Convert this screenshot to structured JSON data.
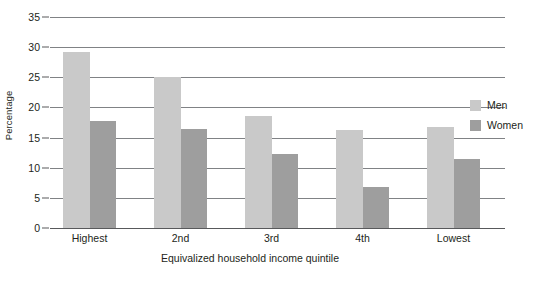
{
  "chart_data": {
    "type": "bar",
    "title": "",
    "subtitle": "",
    "xlabel": "Equivalized household income quintile",
    "ylabel": "Percentage",
    "categories": [
      "Highest",
      "2nd",
      "3rd",
      "4th",
      "Lowest"
    ],
    "series": [
      {
        "name": "Men",
        "color": "#c9c9c9",
        "values": [
          29.2,
          25.0,
          18.5,
          16.3,
          16.8
        ]
      },
      {
        "name": "Women",
        "color": "#9e9e9e",
        "values": [
          17.7,
          16.5,
          12.2,
          6.8,
          11.5
        ]
      }
    ],
    "ylim": [
      0,
      35
    ],
    "yticks": [
      0,
      5,
      10,
      15,
      20,
      25,
      30,
      35
    ],
    "ytick_labels": [
      "0",
      "5",
      "10",
      "15",
      "20",
      "25",
      "30",
      "35"
    ],
    "grid": "horizontal",
    "legend_position": "right",
    "annotations": []
  },
  "legend": {
    "items": [
      {
        "label": "Men",
        "swatch": "#c9c9c9"
      },
      {
        "label": "Women",
        "swatch": "#9e9e9e"
      }
    ]
  },
  "colors": {
    "men": "#c9c9c9",
    "women": "#9e9e9e",
    "gridline": "#808285",
    "axis": "#58595b",
    "text": "#231f20",
    "background": "#ffffff"
  }
}
